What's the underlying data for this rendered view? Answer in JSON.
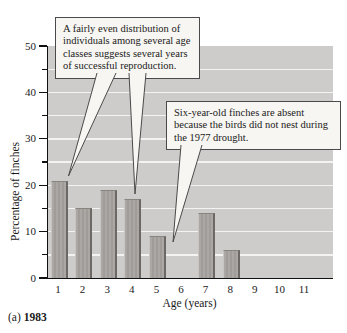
{
  "figure": {
    "panel_label": "(a)",
    "panel_year": "1983"
  },
  "axes": {
    "x_label": "Age (years)",
    "y_label": "Percentage of finches"
  },
  "callouts": {
    "even_distribution": "A fairly even distribution of individuals among several age classes suggests several years of successful reproduction.",
    "six_year_absent": "Six-year-old finches are absent because the birds did not nest during the 1977 drought."
  },
  "chart_data": {
    "type": "bar",
    "title": "",
    "categories": [
      "1",
      "2",
      "3",
      "4",
      "5",
      "6",
      "7",
      "8",
      "9",
      "10",
      "11"
    ],
    "values": [
      21,
      15,
      19,
      17,
      9,
      0,
      14,
      6,
      0,
      0,
      0
    ],
    "xlabel": "Age (years)",
    "ylabel": "Percentage of finches",
    "ylim": [
      0,
      50
    ],
    "yticks_major": [
      0,
      10,
      20,
      30,
      40,
      50
    ],
    "yticks_minor": [
      5,
      15,
      25,
      35,
      45
    ],
    "grid": "horizontal white lines every 5 units",
    "legend": "none",
    "annotations": [
      {
        "text": "A fairly even distribution of individuals among several age classes suggests several years of successful reproduction.",
        "points_to": [
          "age 1 bar",
          "age 4 bar"
        ]
      },
      {
        "text": "Six-year-old finches are absent because the birds did not nest during the 1977 drought.",
        "points_to": [
          "age 6 position (no bar)"
        ]
      }
    ]
  },
  "colors": {
    "plot_background": "#cdcccb",
    "gridline": "#f4f3f1",
    "bar_fill": "#a5a2a0",
    "bar_edge_dark": "#6b6865",
    "axis_line": "#111111",
    "callout_background": "#f7f6f2",
    "callout_border": "#4a4a4a"
  }
}
